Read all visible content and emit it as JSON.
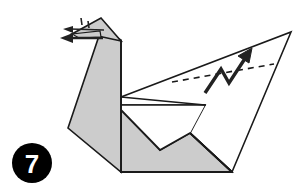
{
  "figure": {
    "kind": "origami-diagram",
    "canvas": {
      "width": 304,
      "height": 193
    },
    "colors": {
      "background": "#ffffff",
      "paper_fill": "#cccccc",
      "paper_fill_light": "#d6d6d6",
      "paper_white": "#ffffff",
      "outline": "#1a1a1a",
      "fold_line": "#1a1a1a",
      "arrow": "#222222",
      "badge_fill": "#000000",
      "badge_text": "#ffffff"
    },
    "step_badge": {
      "label": "7",
      "cx": 32,
      "cy": 163,
      "r": 20
    },
    "shapes": [
      {
        "name": "wing-upper-white-panel",
        "fill": "#ffffff",
        "points": "121,97 291,32 232,172 190,133 205,105 121,105"
      },
      {
        "name": "body-lower-gray-panel",
        "fill": "#cccccc",
        "points": "121,105 205,105 190,133 160,150 121,170"
      },
      {
        "name": "body-base-gray",
        "fill": "#cccccc",
        "points": "121,105 160,150 190,133 232,172 121,172"
      },
      {
        "name": "neck-gray-panel",
        "fill": "#cccccc",
        "points": "101,30 121,40 121,172 68,128"
      },
      {
        "name": "head-gray-panel",
        "fill": "#cccccc",
        "points": "101,18 121,40 101,30 73,33"
      },
      {
        "name": "beak-gray-panel",
        "fill": "#cccccc",
        "points": "73,33 101,30 101,36 78,37"
      }
    ],
    "fold_lines": [
      {
        "name": "wing-top-edge",
        "x1": 121,
        "y1": 97,
        "x2": 291,
        "y2": 32
      },
      {
        "name": "wing-right-edge",
        "x1": 291,
        "y1": 32,
        "x2": 232,
        "y2": 172
      },
      {
        "name": "wing-inner-notch-a",
        "x1": 121,
        "y1": 97,
        "x2": 205,
        "y2": 105
      },
      {
        "name": "horizontal-mid-edge",
        "x1": 120,
        "y1": 105,
        "x2": 205,
        "y2": 105
      },
      {
        "name": "inner-valley-a",
        "x1": 121,
        "y1": 110,
        "x2": 160,
        "y2": 150
      },
      {
        "name": "inner-valley-b",
        "x1": 160,
        "y1": 150,
        "x2": 190,
        "y2": 133
      },
      {
        "name": "tail-right-edge",
        "x1": 190,
        "y1": 133,
        "x2": 232,
        "y2": 172
      },
      {
        "name": "body-bottom-edge",
        "x1": 121,
        "y1": 172,
        "x2": 232,
        "y2": 172
      },
      {
        "name": "neck-front-edge",
        "x1": 68,
        "y1": 128,
        "x2": 101,
        "y2": 30
      },
      {
        "name": "neck-back-edge",
        "x1": 121,
        "y1": 40,
        "x2": 121,
        "y2": 172
      },
      {
        "name": "neck-left-base",
        "x1": 68,
        "y1": 128,
        "x2": 121,
        "y2": 172
      },
      {
        "name": "head-top-edge",
        "x1": 73,
        "y1": 33,
        "x2": 101,
        "y2": 18
      },
      {
        "name": "head-right-edge",
        "x1": 101,
        "y1": 18,
        "x2": 121,
        "y2": 40
      },
      {
        "name": "beak-under-edge",
        "x1": 73,
        "y1": 34,
        "x2": 103,
        "y2": 36
      }
    ],
    "dashed_fold": {
      "name": "wing-crimp-dashed-line",
      "x1": 172,
      "y1": 82,
      "x2": 274,
      "y2": 64,
      "dash": "6 5"
    },
    "arrows": [
      {
        "name": "crimp-zigzag-arrow",
        "kind": "zigzag-pleat-arrow",
        "path": "M 206,92 L 222,68 L 228,82 L 245,58",
        "head_at": [
          250,
          52
        ],
        "head_angle_deg": -55
      },
      {
        "name": "head-push-arrow-upper",
        "kind": "thin-arrow-left",
        "x1": 103,
        "y1": 31,
        "x2": 66,
        "y2": 30
      },
      {
        "name": "head-push-arrow-lower",
        "kind": "bold-arrow-left",
        "x1": 103,
        "y1": 38,
        "x2": 63,
        "y2": 38
      },
      {
        "name": "head-tick-mark",
        "kind": "short-dash",
        "x1": 81,
        "y1": 19,
        "x2": 81,
        "y2": 26
      },
      {
        "name": "head-tick-mark-2",
        "kind": "short-dash",
        "x1": 88,
        "y1": 21,
        "x2": 88,
        "y2": 29
      }
    ]
  }
}
